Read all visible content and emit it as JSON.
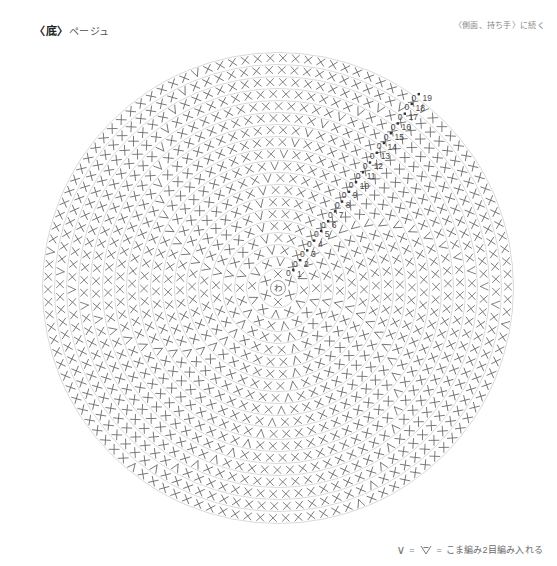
{
  "header": {
    "title_bracket": "〈底〉",
    "title_sub": "ページュ",
    "continue_note": "〈側面、持ち手〉に続く"
  },
  "center": {
    "ring_label": "わ"
  },
  "legend": {
    "symbol_v": "∨",
    "equals_1": "=",
    "symbol_inc": "inc-stitch-icon",
    "equals_2": "=",
    "text": "こま編み2目編み入れる"
  },
  "chart_data": {
    "type": "diagram",
    "title": "〈底〉ページュ",
    "subtype": "crochet-round-base-chart",
    "center_label": "わ",
    "stitch_symbols": {
      "single_crochet": "×",
      "increase": "∨"
    },
    "row_count": 19,
    "rows": [
      {
        "row": 1,
        "label": "1",
        "stitches": 6,
        "increases": 0,
        "radius": 14
      },
      {
        "row": 2,
        "label": "2",
        "stitches": 12,
        "increases": 6,
        "radius": 26
      },
      {
        "row": 3,
        "label": "3",
        "stitches": 18,
        "increases": 6,
        "radius": 38
      },
      {
        "row": 4,
        "label": "4",
        "stitches": 24,
        "increases": 6,
        "radius": 50
      },
      {
        "row": 5,
        "label": "5",
        "stitches": 30,
        "increases": 6,
        "radius": 62
      },
      {
        "row": 6,
        "label": "6",
        "stitches": 36,
        "increases": 6,
        "radius": 74
      },
      {
        "row": 7,
        "label": "7",
        "stitches": 42,
        "increases": 6,
        "radius": 86
      },
      {
        "row": 8,
        "label": "8",
        "stitches": 48,
        "increases": 6,
        "radius": 98
      },
      {
        "row": 9,
        "label": "9",
        "stitches": 54,
        "increases": 6,
        "radius": 110
      },
      {
        "row": 10,
        "label": "10",
        "stitches": 60,
        "increases": 6,
        "radius": 122
      },
      {
        "row": 11,
        "label": "11",
        "stitches": 66,
        "increases": 6,
        "radius": 134
      },
      {
        "row": 12,
        "label": "12",
        "stitches": 72,
        "increases": 6,
        "radius": 146
      },
      {
        "row": 13,
        "label": "13",
        "stitches": 78,
        "increases": 6,
        "radius": 158
      },
      {
        "row": 14,
        "label": "14",
        "stitches": 84,
        "increases": 6,
        "radius": 170
      },
      {
        "row": 15,
        "label": "15",
        "stitches": 90,
        "increases": 6,
        "radius": 182
      },
      {
        "row": 16,
        "label": "16",
        "stitches": 96,
        "increases": 6,
        "radius": 194
      },
      {
        "row": 17,
        "label": "17",
        "stitches": 102,
        "increases": 6,
        "radius": 206
      },
      {
        "row": 18,
        "label": "18",
        "stitches": 108,
        "increases": 6,
        "radius": 218
      },
      {
        "row": 19,
        "label": "19",
        "stitches": 114,
        "increases": 6,
        "radius": 230
      }
    ],
    "row_marker_symbol": "0",
    "colors": {
      "stitch": "#6f6f6f",
      "guide_line": "#c9c9c9",
      "row_label": "#4a4a4a",
      "background": "#ffffff"
    },
    "center_x": 278,
    "center_y": 288
  }
}
